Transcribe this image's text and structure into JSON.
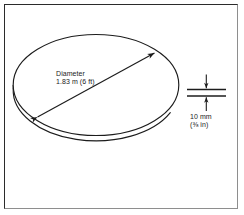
{
  "figure": {
    "kind": "technical-line-drawing",
    "background_color": "#ffffff",
    "line_color": "#1c1c1c",
    "frame": {
      "border_color_dark": "#2b2b2b",
      "border_color_light": "#8e8e8e"
    }
  },
  "disk": {
    "name": "disk-body",
    "top_face_name": "disk-top-ellipse",
    "edge_name": "disk-edge-arc"
  },
  "diameter_callout": {
    "name": "diameter-dimension",
    "line_1": "Diameter",
    "line_2": "1.83 m (6 ft)",
    "value_metric": "1.83 m",
    "value_imperial": "6 ft",
    "arrow_style": "double-headed"
  },
  "thickness_callout": {
    "name": "thickness-dimension",
    "line_1": "10 mm",
    "line_2": "(⅜ in)",
    "value_metric": "10 mm",
    "value_imperial": "⅜ in",
    "arrow_style": "inward-pointing-pair"
  }
}
